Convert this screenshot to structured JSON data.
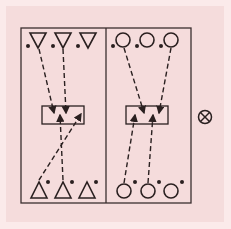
{
  "diagram": {
    "background_color": "#f5dcdc",
    "stroke_color": "#2a2020",
    "left_panel": {
      "top_row": [
        "triangle-down",
        "triangle-down",
        "triangle-down"
      ],
      "bottom_row": [
        "triangle-up",
        "triangle-up",
        "triangle-up"
      ],
      "center_box": "rectangle",
      "arrows": [
        {
          "from": "top-1",
          "to": "box"
        },
        {
          "from": "top-2",
          "to": "box"
        },
        {
          "from": "bottom-1",
          "to": "box-right"
        },
        {
          "from": "bottom-2",
          "to": "box"
        }
      ]
    },
    "right_panel": {
      "top_row": [
        "circle",
        "circle",
        "circle"
      ],
      "bottom_row": [
        "circle",
        "circle",
        "circle"
      ],
      "center_box": "rectangle",
      "arrows": [
        {
          "from": "top-1",
          "to": "box"
        },
        {
          "from": "top-3",
          "to": "box"
        },
        {
          "from": "bottom-1",
          "to": "box"
        },
        {
          "from": "bottom-2",
          "to": "box"
        }
      ]
    },
    "side_symbol": "circled-x"
  }
}
